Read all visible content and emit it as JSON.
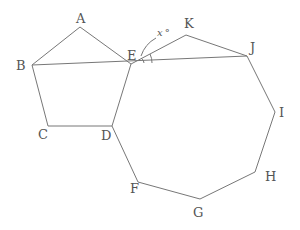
{
  "figure": {
    "pentagon": [
      "A",
      "B",
      "C",
      "D",
      "E"
    ],
    "nonagon": [
      "E",
      "K",
      "J",
      "I",
      "H",
      "G",
      "F",
      "D"
    ],
    "labels": {
      "A": "A",
      "B": "B",
      "C": "C",
      "D": "D",
      "E": "E",
      "F": "F",
      "G": "G",
      "H": "H",
      "I": "I",
      "J": "J",
      "K": "K"
    },
    "angle_label": "x",
    "angle_unit": "°"
  }
}
